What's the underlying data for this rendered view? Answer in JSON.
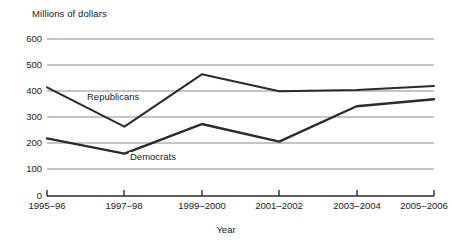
{
  "chart_data": {
    "type": "line",
    "title": "",
    "ylabel": "Millions of dollars",
    "xlabel": "Year",
    "categories": [
      "1995–96",
      "1997–98",
      "1999–2000",
      "2001–2002",
      "2003–2004",
      "2005–2006"
    ],
    "series": [
      {
        "name": "Republicans",
        "values": [
          415,
          265,
          465,
          400,
          405,
          420
        ],
        "color": "#2b2b2b"
      },
      {
        "name": "Democrats",
        "values": [
          220,
          162,
          275,
          208,
          343,
          370
        ],
        "color": "#2b2b2b"
      }
    ],
    "ylim": [
      0,
      600
    ],
    "yticks": [
      0,
      100,
      200,
      300,
      400,
      500,
      600
    ],
    "ytick_labels": [
      "0",
      "100",
      "200",
      "300",
      "400",
      "500",
      "600"
    ],
    "grid": true,
    "grid_color": "#8a8a8a",
    "legend": "inline-labels",
    "annotations": [
      {
        "text": "Republicans",
        "x_px": 86,
        "y_px": 92
      },
      {
        "text": "Democrats",
        "x_px": 129,
        "y_px": 152
      }
    ]
  }
}
